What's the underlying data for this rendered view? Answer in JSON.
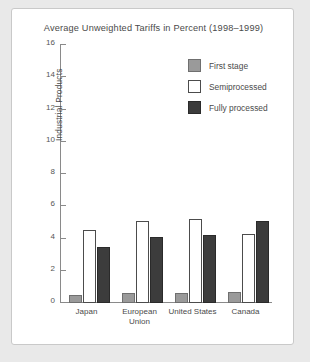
{
  "chart_data": {
    "type": "bar",
    "title": "Average Unweighted Tariffs in Percent (1998–1999)",
    "xlabel": "",
    "ylabel": "Industrial Products",
    "categories": [
      "Japan",
      "European\nUnion",
      "United States",
      "Canada"
    ],
    "ylim": [
      0,
      16
    ],
    "yticks": [
      0,
      2,
      4,
      6,
      8,
      10,
      12,
      14,
      16
    ],
    "grid": false,
    "legend_position": "upper right",
    "series": [
      {
        "name": "First stage",
        "color": "#9a9a9a",
        "values": [
          0.5,
          0.6,
          0.6,
          0.7
        ]
      },
      {
        "name": "Semiprocessed",
        "color": "#ffffff",
        "values": [
          4.5,
          5.1,
          5.2,
          4.3
        ]
      },
      {
        "name": "Fully processed",
        "color": "#3c3c3c",
        "values": [
          3.5,
          4.1,
          4.2,
          5.1
        ]
      }
    ]
  }
}
